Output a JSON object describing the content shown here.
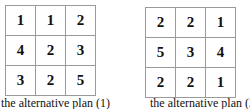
{
  "plans": [
    {
      "caption": "the alternative plan (1)",
      "grid": [
        [
          "1",
          "1",
          "2"
        ],
        [
          "4",
          "2",
          "3"
        ],
        [
          "3",
          "2",
          "5"
        ]
      ]
    },
    {
      "caption": "the alternative plan (2)",
      "grid": [
        [
          "2",
          "2",
          "1"
        ],
        [
          "5",
          "3",
          "4"
        ],
        [
          "2",
          "2",
          "1"
        ]
      ]
    }
  ]
}
